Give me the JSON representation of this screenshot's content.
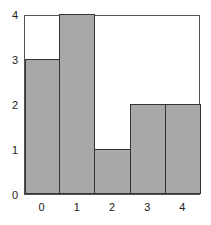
{
  "chart_data": {
    "type": "bar",
    "title": "",
    "xlabel": "",
    "ylabel": "",
    "categories": [
      "0",
      "1",
      "2",
      "3",
      "4"
    ],
    "values": [
      3,
      4,
      1,
      2,
      2
    ],
    "ylim": [
      0,
      4
    ],
    "yticks": [
      "0",
      "1",
      "2",
      "3",
      "4"
    ],
    "grid": false,
    "legend": null,
    "bar_color": "#a8a8a8",
    "edge_color": "#333333"
  }
}
